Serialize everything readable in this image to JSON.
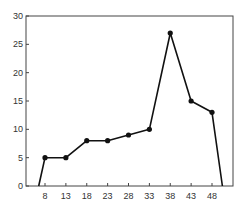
{
  "chart_data": {
    "type": "line",
    "title": "",
    "xlabel": "",
    "ylabel": "",
    "x_ticks": [
      8,
      13,
      18,
      23,
      28,
      33,
      38,
      43,
      48
    ],
    "y_ticks": [
      0,
      5,
      10,
      15,
      20,
      25,
      30
    ],
    "xlim": [
      2,
      53
    ],
    "ylim": [
      0,
      30
    ],
    "grid": false,
    "legend": null,
    "series": [
      {
        "name": "frequency polygon",
        "x": [
          6.5,
          8,
          13,
          18,
          23,
          28,
          33,
          38,
          43,
          48,
          50.5
        ],
        "values": [
          0,
          5,
          5,
          8,
          8,
          9,
          10,
          27,
          15,
          13,
          0
        ],
        "markers": [
          false,
          true,
          true,
          true,
          true,
          true,
          true,
          true,
          true,
          true,
          false
        ]
      }
    ],
    "colors": {
      "line": "#111111",
      "axis": "#444444",
      "text": "#333333"
    }
  }
}
